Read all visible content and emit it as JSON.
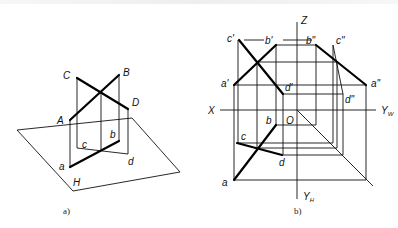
{
  "figure_a": {
    "caption": "a)",
    "plane_label": "H",
    "points_3d": {
      "A": "A",
      "B": "B",
      "C": "C",
      "D": "D"
    },
    "points_proj": {
      "a": "a",
      "b": "b",
      "c": "c",
      "d": "d"
    }
  },
  "figure_b": {
    "caption": "b)",
    "axes": {
      "Z": "Z",
      "X": "X",
      "O": "O",
      "Yw": "Y",
      "Yw_sub": "W",
      "Yh": "Y",
      "Yh_sub": "H"
    },
    "front_view": {
      "a": "a'",
      "b": "b'",
      "c": "c'",
      "d": "d'"
    },
    "side_view": {
      "a": "a\"",
      "b": "b\"",
      "c": "c\"",
      "d": "d\""
    },
    "top_view": {
      "a": "a",
      "b": "b",
      "c": "c",
      "d": "d"
    }
  }
}
